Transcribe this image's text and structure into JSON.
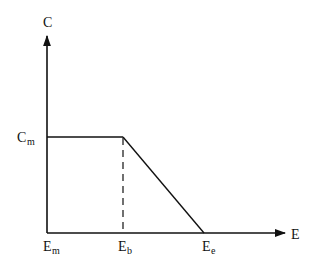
{
  "diagram": {
    "type": "piecewise-linear-curve",
    "colors": {
      "line": "#111111",
      "background": "#ffffff"
    },
    "y_axis": {
      "label": "C"
    },
    "x_axis": {
      "label": "E"
    },
    "labels": {
      "cm": {
        "main": "C",
        "sub": "m"
      },
      "em": {
        "main": "E",
        "sub": "m"
      },
      "eb": {
        "main": "E",
        "sub": "b"
      },
      "ee": {
        "main": "E",
        "sub": "e"
      }
    },
    "segments": [
      {
        "name": "plateau",
        "from": "(Em, Cm)",
        "to": "(Eb, Cm)",
        "style": "solid"
      },
      {
        "name": "decline",
        "from": "(Eb, Cm)",
        "to": "(Ee, 0)",
        "style": "solid"
      },
      {
        "name": "drop-guide",
        "from": "(Eb, Cm)",
        "to": "(Eb, 0)",
        "style": "dashed"
      }
    ]
  }
}
